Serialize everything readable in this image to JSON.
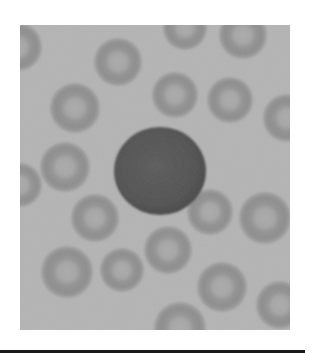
{
  "image": {
    "subject": "Blood smear micrograph: central lymphocyte surrounded by red blood cells",
    "palette": {
      "background": "#b4b4b4",
      "rbc_ring": "#8f8f8f",
      "rbc_center": "#a9a9a9",
      "lymphocyte": "#555555",
      "lymphocyte_edge": "#4a4a4a",
      "page": "#ffffff",
      "rule": "#1a1a1a"
    },
    "frame": {
      "x": 20,
      "y": 25,
      "width": 270,
      "height": 305
    },
    "lymphocyte": {
      "cx": 160,
      "cy": 171,
      "rx": 46,
      "ry": 44
    },
    "rbcs": [
      {
        "cx": 18,
        "cy": 47,
        "r": 24
      },
      {
        "cx": 118,
        "cy": 62,
        "r": 24
      },
      {
        "cx": 185,
        "cy": 28,
        "r": 22
      },
      {
        "cx": 243,
        "cy": 35,
        "r": 24
      },
      {
        "cx": 175,
        "cy": 95,
        "r": 23
      },
      {
        "cx": 230,
        "cy": 100,
        "r": 23
      },
      {
        "cx": 287,
        "cy": 118,
        "r": 24
      },
      {
        "cx": 75,
        "cy": 108,
        "r": 25
      },
      {
        "cx": 65,
        "cy": 167,
        "r": 25
      },
      {
        "cx": 20,
        "cy": 185,
        "r": 22
      },
      {
        "cx": 95,
        "cy": 218,
        "r": 24
      },
      {
        "cx": 210,
        "cy": 212,
        "r": 23
      },
      {
        "cx": 265,
        "cy": 218,
        "r": 26
      },
      {
        "cx": 168,
        "cy": 250,
        "r": 24
      },
      {
        "cx": 67,
        "cy": 272,
        "r": 26
      },
      {
        "cx": 122,
        "cy": 270,
        "r": 22
      },
      {
        "cx": 222,
        "cy": 287,
        "r": 25
      },
      {
        "cx": 180,
        "cy": 328,
        "r": 26
      },
      {
        "cx": 280,
        "cy": 305,
        "r": 24
      }
    ]
  }
}
